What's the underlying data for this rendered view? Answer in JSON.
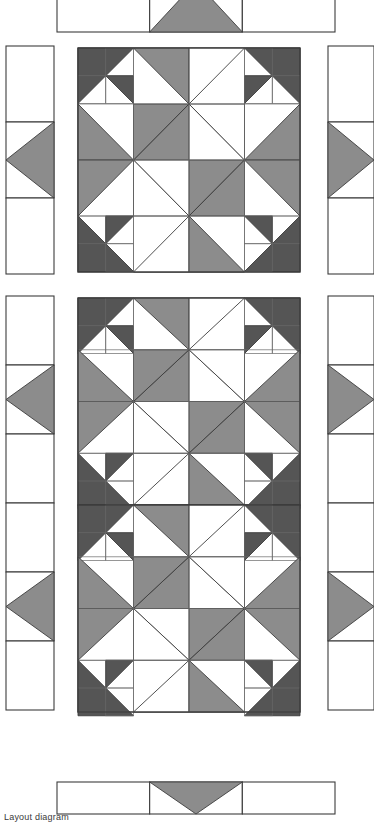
{
  "document": {
    "kind": "quilt-layout-diagram",
    "caption": "Layout diagram",
    "page_width": 374,
    "page_height": 820
  },
  "palette": {
    "background": "#ffffff",
    "fabric_light": "#ffffff",
    "fabric_medium": "#8c8c8c",
    "fabric_dark": "#555555",
    "outline": "#3c3c3c",
    "outline_inner": "#6a6a6a",
    "caption_color": "#3a3a3a"
  },
  "line_weights": {
    "block_outline": 1.1,
    "unit_grid": 0.7,
    "patch_edge": 0.9,
    "border_outline": 1.1
  },
  "legend": {
    "fabrics": [
      {
        "name": "light",
        "swatch": "#ffffff",
        "label": "Light"
      },
      {
        "name": "medium",
        "swatch": "#8c8c8c",
        "label": "Medium"
      },
      {
        "name": "dark",
        "swatch": "#555555",
        "label": "Dark"
      }
    ]
  },
  "layout": {
    "rows": 3,
    "columns": 3,
    "description": "Center panel of pieced blocks surrounded by flying-geese border strips on all four sides.",
    "sections": [
      {
        "name": "top-border-strip",
        "role": "border",
        "orientation": "horizontal",
        "clipped": true
      },
      {
        "name": "upper-block-panel",
        "role": "center",
        "blocks_down": 1,
        "blocks_across": 1
      },
      {
        "name": "lower-block-panel",
        "role": "center",
        "blocks_down": 2,
        "blocks_across": 1
      },
      {
        "name": "bottom-border-strip",
        "role": "border",
        "orientation": "horizontal",
        "clipped": false
      },
      {
        "name": "left-border-strip",
        "role": "border",
        "orientation": "vertical"
      },
      {
        "name": "right-border-strip",
        "role": "border",
        "orientation": "vertical"
      }
    ]
  },
  "block": {
    "name": "star-in-square-block",
    "grid": 8,
    "width_px": 222,
    "height_px": 224,
    "components": [
      {
        "name": "corner-half-square-triangle-units",
        "count": 4,
        "fabric": "dark"
      },
      {
        "name": "on-point-center-square",
        "count": 1,
        "fabric": "light"
      },
      {
        "name": "pinwheel-center",
        "count": 4,
        "fabric": "medium"
      },
      {
        "name": "edge-flying-geese",
        "count": 4,
        "fabric": "medium"
      }
    ]
  },
  "border_strips": {
    "vertical_left": {
      "name": "left-border-strip",
      "cells": 3,
      "geese_index": 1,
      "geese_direction": "left",
      "geese_fabric": "medium"
    },
    "vertical_right": {
      "name": "right-border-strip",
      "cells": 3,
      "geese_index": 1,
      "geese_direction": "right",
      "geese_fabric": "medium"
    },
    "horizontal_top": {
      "name": "top-border-strip",
      "cells": 3,
      "geese_index": 1,
      "geese_direction": "up",
      "geese_fabric": "medium"
    },
    "horizontal_bottom": {
      "name": "bottom-border-strip",
      "cells": 3,
      "geese_index": 1,
      "geese_direction": "down",
      "geese_fabric": "medium"
    }
  },
  "geometry": {
    "top_strip": {
      "x": 57,
      "y": -18,
      "w": 278,
      "h": 50
    },
    "bottom_strip": {
      "x": 57,
      "y": 782,
      "w": 278,
      "h": 32
    },
    "left_strip_upper": {
      "x": 6,
      "y": 46,
      "w": 48,
      "h": 228
    },
    "right_strip_upper": {
      "x": 328,
      "y": 46,
      "w": 46,
      "h": 228
    },
    "left_strip_lower": {
      "x": 6,
      "y": 296,
      "w": 48,
      "h": 414
    },
    "right_strip_lower": {
      "x": 328,
      "y": 296,
      "w": 46,
      "h": 414
    },
    "block_upper": {
      "x": 78,
      "y": 48,
      "w": 222,
      "h": 224
    },
    "block_lower": {
      "x": 78,
      "y": 298,
      "w": 222,
      "h": 414
    }
  }
}
